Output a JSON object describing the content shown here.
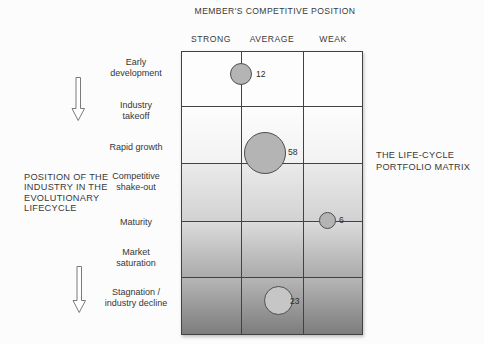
{
  "header": {
    "title": "MEMBER'S COMPETITIVE POSITION"
  },
  "columns": [
    {
      "label": "STRONG"
    },
    {
      "label": "AVERAGE"
    },
    {
      "label": "WEAK"
    }
  ],
  "rows": [
    {
      "label": "Early\ndevelopment"
    },
    {
      "label": "Industry\ntakeoff"
    },
    {
      "label": "Rapid growth"
    },
    {
      "label": "Competitive\nshake-out"
    },
    {
      "label": "Maturity"
    },
    {
      "label": "Market\nsaturation"
    },
    {
      "label": "Stagnation /\nindustry decline"
    }
  ],
  "left_caption": "POSITION OF THE\nINDUSTRY IN THE\nEVOLUTIONARY\nLIFECYCLE",
  "right_caption": "THE LIFE-CYCLE\nPORTFOLIO MATRIX",
  "bubbles": [
    {
      "value": "12",
      "row": "Early development",
      "column": "AVERAGE"
    },
    {
      "value": "58",
      "row": "Rapid growth",
      "column": "AVERAGE"
    },
    {
      "value": "6",
      "row": "Maturity",
      "column": "WEAK"
    },
    {
      "value": "23",
      "row": "Stagnation / industry decline",
      "column": "AVERAGE"
    }
  ],
  "colors": {
    "bubble_fill": "#b4b4b4",
    "bubble_outline": "#4e4e4e",
    "grid_line": "#424242",
    "gradient_bottom": "#7d7d7d"
  }
}
